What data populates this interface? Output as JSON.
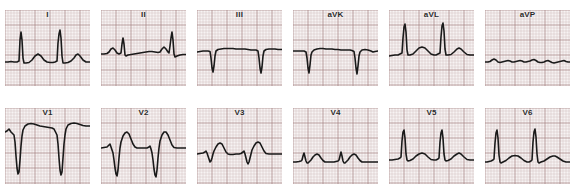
{
  "document": {
    "title": "12-Lead Electrocardiogram",
    "background_color": "#ffffff"
  },
  "grid_style": {
    "paper_color": "#f7f3f3",
    "minor_line_color": "#c9b5b5",
    "major_line_color": "#a07f7f",
    "trace_color": "#1a1a1a",
    "minor_step_px": 3,
    "major_every": 5,
    "trace_width_px": 1.6
  },
  "layout": {
    "rows": 2,
    "columns": 6,
    "panel_width": 85,
    "panel_height": 76,
    "row_tops": [
      10,
      108
    ],
    "column_lefts": [
      5,
      101,
      197,
      293,
      389,
      485
    ]
  },
  "chart_data": {
    "type": "line",
    "xlabel": "Time",
    "ylabel": "Amplitude (mV)",
    "grid": true,
    "legend": "none",
    "x_unit": "0.04 s per small square",
    "y_unit": "0.1 mV per small square",
    "panels": [
      {
        "label": "I",
        "row": 0,
        "column": 0,
        "baseline_y": 52,
        "description": "Tall narrow R waves with small upright T waves",
        "points": "0,52 3,52 6,51.5 9,52 12,52 14,51 15,30 16,22 17,30 18,48 19,53 21,53 24,52.5 27,50 30,46 33,44 36,46 39,50 42,52 45,52.5 48,52.5 50,52 52,51 53,33 54,24 55,20 56,28 57,46 58,53 60,53 63,52.5 66,51 69,48 71,45 73,44 75,46 78,50 81,52 85,52"
      },
      {
        "label": "II",
        "row": 0,
        "column": 1,
        "baseline_y": 44,
        "description": "Moderate R waves with low flat T waves, baseline high in panel",
        "points": "0,44 3,44 6,43.5 8,42 10,39 12,38 14,40 16,43 18,44 20,43 21,34 22,28 23,34 24,45 25,46 27,45 30,44.5 33,44 36,43.5 39,43 42,42.5 45,42 48,41.5 51,41.5 54,42 57,42.5 59,42 61,39 63,37 65,39 67,42 68,43 69,36 70,28 71,22 72,30 73,44 74,47 76,46 79,45 82,44.5 85,44.5"
      },
      {
        "label": "III",
        "row": 0,
        "column": 2,
        "baseline_y": 42,
        "description": "Deep narrow negative QS complexes below an elevated baseline",
        "points": "0,42 3,41.5 6,41 9,41 11,41 13,41.5 14,48 15,58 16,62 17,56 18,46 19,41 21,39.5 24,39 27,38.5 30,38.5 33,38.5 36,38.5 39,39 42,39 45,39 48,39 51,39.5 54,40 57,40 59,40 61,41 62,48 63,58 64,63 65,57 66,46 67,41 69,39.5 72,39 75,39 78,39 81,39.5 85,39.5"
      },
      {
        "label": "aVK",
        "row": 0,
        "column": 3,
        "baseline_y": 41,
        "description": "Predominantly negative deflections with deep narrow S waves",
        "points": "0,41 3,41 6,41 9,41 11,41 13,42 14,48 15,58 16,63 17,55 18,45 19,42 21,40 24,39 27,38.5 30,38.5 33,39 36,39 39,39 42,39.5 45,39.5 48,40 51,40 54,40 57,40 59,40.5 61,41.5 62,48 63,58 64,64 65,56 66,46 67,42 69,40 72,39.5 75,40 78,41 80,42 82,41.5 85,41"
      },
      {
        "label": "aVL",
        "row": 0,
        "column": 4,
        "baseline_y": 46,
        "description": "Very tall narrow R waves with broad low T waves",
        "points": "0,46 3,45.5 6,45 9,45 11,44 13,43 14,28 15,17 16,14 17,22 18,40 19,45 21,45 24,44 27,41 30,38 33,37 36,38 39,41 42,44 45,45 47,45 49,44 51,43 52,27 53,16 54,13 55,21 56,39 57,45 59,45 62,44.5 65,42 68,39 70,38 72,39 75,42 78,44.5 81,45 85,45"
      },
      {
        "label": "aVP",
        "row": 0,
        "column": 5,
        "baseline_y": 52,
        "description": "Low amplitude nearly isoelectric complexes",
        "points": "0,52 3,52 5,51.5 7,50 9,49 11,50 13,52 15,52.5 17,52 19,51.5 21,51 23,50.5 25,51 27,52 29,52 31,51.5 33,51 35,50.5 37,51 39,52 41,52 43,51.5 45,51 47,50 49,49.5 51,50.5 53,52 55,52.5 57,52.5 59,52 61,51 63,50.5 65,51.5 67,52.5 69,53 71,52.5 73,52 75,51.5 77,51 79,50.5 81,51.5 83,52 85,52"
      },
      {
        "label": "V1",
        "row": 1,
        "column": 0,
        "baseline_y": 24,
        "description": "Deep wide S waves with broad elevated ST segment and plateau T waves",
        "points": "0,24 2,23 4,21 6,24 8,26 9,27 10,34 11,48 12,60 13,66 14,64 15,52 16,38 17,28 18,22 20,18 23,16 26,15.5 29,16 32,17 35,18 38,18.5 41,19 44,19.5 47,20 49,21 51,25 52,27 53,36 54,50 55,62 56,67 57,64 58,50 59,36 60,27 61,21 63,17 66,15.5 69,15 72,15.5 75,16.5 78,17.5 81,18 85,18"
      },
      {
        "label": "V2",
        "row": 1,
        "column": 1,
        "baseline_y": 40,
        "description": "Deep narrow S waves followed by tall rounded T waves",
        "points": "0,40 3,39.5 6,39 8,37 9,36 10,39 11,42 12,45 13,52 14,60 15,66 16,68 17,62 18,50 19,40 20,34 22,28 24,25 26,24 28,26 30,31 32,36 34,39 36,40 38,40 41,40 44,40 46,40 48,39 49,38 50,41 51,45 52,52 53,61 54,67 55,69 56,62 57,50 58,40 59,33 61,27 63,24 65,24 67,27 69,32 71,37 73,39.5 76,40 79,40 82,40 85,40"
      },
      {
        "label": "V3",
        "row": 1,
        "column": 2,
        "baseline_y": 46,
        "description": "Small r waves with shallow s waves and rounded T waves",
        "points": "0,46 3,45.5 6,45 8,44 9,43 10,45 11,48 12,51 13,54 14,53 15,50 16,46 17,43 19,39 21,36 23,35 25,36 27,40 29,44 31,46 33,46.5 36,46.5 39,46 42,46 44,45.5 46,44 47,43 48,46 49,50 50,54 51,56 52,54 53,50 54,46 55,42 57,38 59,35 61,34 63,35 65,39 67,43 69,45.5 72,46 75,46 78,46 81,46 85,46"
      },
      {
        "label": "V4",
        "row": 1,
        "column": 3,
        "baseline_y": 54,
        "description": "Small R waves with broad rounded T waves, low amplitude",
        "points": "0,54 3,54 6,53.5 8,53 9,52 10,48 11,45 12,49 13,53 14,55 15,55 16,54 18,52 20,49 22,47 24,46 26,47 28,50 30,52.5 32,54 35,54 38,54 41,54 43,53.5 45,53 46,52 47,48 48,44 49,48 50,53 51,55 52,55 53,54 55,52 57,49 59,47 61,46 63,47 65,50 67,52.5 69,54 72,54 75,54 78,54 81,54 85,54"
      },
      {
        "label": "V5",
        "row": 1,
        "column": 4,
        "baseline_y": 52,
        "description": "Tall narrow R waves with broad low T waves",
        "points": "0,52 3,52 6,51.5 9,51 11,50 12,49 13,33 14,24 15,22 16,30 17,46 18,52 19,53 21,52.5 24,51 27,48 30,46 33,45 36,46 39,49 42,51.5 45,52 47,52 49,51 50,50 51,34 52,25 53,22 54,30 55,46 56,52 57,53 59,52.5 62,51 65,48 68,46 70,45 72,46 75,49 78,51.5 81,52 85,52"
      },
      {
        "label": "V6",
        "row": 1,
        "column": 5,
        "baseline_y": 54,
        "description": "Tall narrow R waves with small rounded T waves",
        "points": "0,54 2,54 4,53.5 6,53 8,52 9,51 10,35 11,25 12,22 13,30 14,47 15,54 16,55 18,54 21,52.5 24,50 27,48 30,47.5 33,48 36,50 39,52.5 42,54 44,54 46,53 47,52 48,34 49,24 50,21 51,29 52,46 53,54 54,55 56,54 59,53 62,51 65,49 68,48 70,48 72,49 75,51 78,53 81,54 85,54"
      }
    ]
  }
}
